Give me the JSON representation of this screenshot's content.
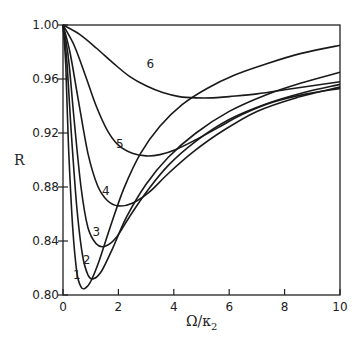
{
  "chart_data": {
    "type": "line",
    "title": "",
    "xlabel": "Ω/κ₂",
    "xlabel_main": "Ω/κ",
    "xlabel_sub": "2",
    "ylabel": "R",
    "xlim": [
      0,
      10
    ],
    "ylim": [
      0.8,
      1.0
    ],
    "xticks": [
      0,
      2,
      4,
      6,
      8,
      10
    ],
    "xtick_labels": [
      "0",
      "2",
      "4",
      "6",
      "8",
      "10"
    ],
    "yticks": [
      0.8,
      0.84,
      0.88,
      0.92,
      0.96,
      1.0
    ],
    "ytick_labels": [
      "0.80",
      "0.84",
      "0.88",
      "0.92",
      "0.96",
      "1.00"
    ],
    "grid": false,
    "legend": "none (curves labeled inline 1-6)",
    "series": [
      {
        "name": "1",
        "label_pos": [
          0.5,
          0.815
        ],
        "x": [
          0,
          0.1,
          0.2,
          0.35,
          0.5,
          0.65,
          0.8,
          1.0,
          1.3,
          1.7,
          2.2,
          2.8,
          3.5,
          4.3,
          5.2,
          6.2,
          7.3,
          8.6,
          10
        ],
        "y": [
          1.0,
          0.97,
          0.91,
          0.85,
          0.817,
          0.806,
          0.805,
          0.81,
          0.825,
          0.85,
          0.879,
          0.905,
          0.925,
          0.941,
          0.953,
          0.963,
          0.971,
          0.979,
          0.985
        ]
      },
      {
        "name": "2",
        "label_pos": [
          0.85,
          0.826
        ],
        "x": [
          0,
          0.15,
          0.3,
          0.5,
          0.7,
          0.9,
          1.1,
          1.4,
          1.8,
          2.3,
          3.0,
          3.8,
          4.8,
          6.0,
          7.3,
          8.6,
          10
        ],
        "y": [
          1.0,
          0.97,
          0.92,
          0.865,
          0.83,
          0.815,
          0.812,
          0.818,
          0.835,
          0.858,
          0.882,
          0.902,
          0.92,
          0.936,
          0.948,
          0.957,
          0.965
        ]
      },
      {
        "name": "3",
        "label_pos": [
          1.2,
          0.847
        ],
        "x": [
          0,
          0.2,
          0.4,
          0.65,
          0.9,
          1.2,
          1.5,
          1.9,
          2.4,
          3.0,
          3.8,
          4.8,
          6.0,
          7.4,
          8.7,
          10
        ],
        "y": [
          1.0,
          0.975,
          0.93,
          0.88,
          0.85,
          0.838,
          0.836,
          0.842,
          0.858,
          0.876,
          0.896,
          0.914,
          0.93,
          0.942,
          0.95,
          0.956
        ]
      },
      {
        "name": "4",
        "label_pos": [
          1.55,
          0.877
        ],
        "x": [
          0,
          0.25,
          0.55,
          0.9,
          1.25,
          1.6,
          2.0,
          2.5,
          3.1,
          3.8,
          4.7,
          5.8,
          7.0,
          8.4,
          10
        ],
        "y": [
          1.0,
          0.98,
          0.945,
          0.905,
          0.881,
          0.87,
          0.866,
          0.868,
          0.876,
          0.89,
          0.906,
          0.922,
          0.936,
          0.946,
          0.954
        ]
      },
      {
        "name": "5",
        "label_pos": [
          2.05,
          0.912
        ],
        "x": [
          0,
          0.4,
          0.8,
          1.2,
          1.6,
          2.0,
          2.5,
          3.0,
          3.5,
          4.1,
          4.8,
          5.6,
          6.5,
          7.6,
          8.8,
          10
        ],
        "y": [
          1.0,
          0.985,
          0.963,
          0.94,
          0.922,
          0.911,
          0.905,
          0.903,
          0.904,
          0.908,
          0.915,
          0.924,
          0.934,
          0.943,
          0.949,
          0.953
        ]
      },
      {
        "name": "6",
        "label_pos": [
          3.15,
          0.971
        ],
        "x": [
          0,
          0.6,
          1.2,
          1.8,
          2.4,
          3.0,
          3.6,
          4.2,
          4.8,
          5.4,
          6.0,
          7.0,
          8.0,
          9.0,
          10
        ],
        "y": [
          1.0,
          0.993,
          0.983,
          0.972,
          0.962,
          0.955,
          0.95,
          0.947,
          0.946,
          0.946,
          0.947,
          0.949,
          0.952,
          0.955,
          0.958
        ]
      }
    ]
  }
}
